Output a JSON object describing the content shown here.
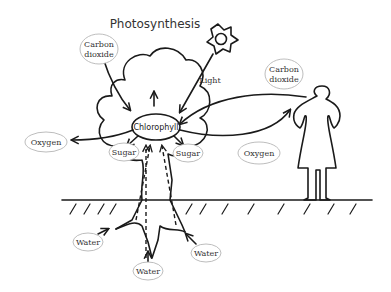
{
  "title": "Photosynthesis",
  "labels": {
    "carbon_dioxide_left": [
      "Carbon",
      "dioxide"
    ],
    "carbon_dioxide_right": [
      "Carbon",
      "dioxide"
    ],
    "light": "Light",
    "chlorophyll": "Chlorophyll",
    "oxygen_left": "Oxygen",
    "oxygen_right": "Oxygen",
    "sugar_left": "Sugar",
    "sugar_right": "Sugar",
    "water_left": "Water",
    "water_center": "Water",
    "water_right": "Water"
  },
  "icons": {
    "sun": "sun-icon",
    "person": "person-icon",
    "tree": "tree-icon"
  }
}
